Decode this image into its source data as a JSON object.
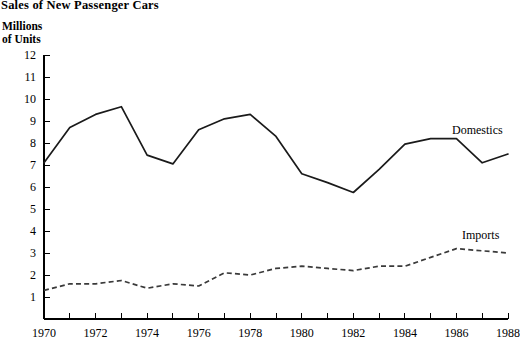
{
  "title": "l Sales of New Passenger Cars",
  "y_axis_title_line1": "Millions",
  "y_axis_title_line2": "of Units",
  "labels": {
    "domestics": "Domestics",
    "imports": "Imports"
  },
  "chart_data": {
    "type": "line",
    "title": "l Sales of New Passenger Cars",
    "xlabel": "",
    "ylabel": "Millions of Units",
    "ylim": [
      0,
      12
    ],
    "xlim": [
      1970,
      1988
    ],
    "grid": false,
    "legend_position": "inline-right",
    "y_ticks": [
      1,
      2,
      3,
      4,
      5,
      6,
      7,
      8,
      9,
      10,
      11,
      12
    ],
    "y_tick_labels": [
      "1",
      "2",
      "3",
      "4",
      "5",
      "6",
      "7",
      "8",
      "9",
      "10",
      "11",
      "12"
    ],
    "x_ticks": [
      1970,
      1971,
      1972,
      1973,
      1974,
      1975,
      1976,
      1977,
      1978,
      1979,
      1980,
      1981,
      1982,
      1983,
      1984,
      1985,
      1986,
      1987,
      1988
    ],
    "x_tick_labels_shown": [
      "1970",
      "1972",
      "1974",
      "1976",
      "1978",
      "1980",
      "1982",
      "1984",
      "1986",
      "1988"
    ],
    "x": [
      1970,
      1971,
      1972,
      1973,
      1974,
      1975,
      1976,
      1977,
      1978,
      1979,
      1980,
      1981,
      1982,
      1983,
      1984,
      1985,
      1986,
      1987,
      1988
    ],
    "series": [
      {
        "name": "Domestics",
        "style": "solid",
        "color": "#1a1a1a",
        "values": [
          7.1,
          8.7,
          9.3,
          9.65,
          7.45,
          7.05,
          8.6,
          9.1,
          9.3,
          8.3,
          6.6,
          6.2,
          5.75,
          6.8,
          7.95,
          8.2,
          8.2,
          7.1,
          7.5
        ]
      },
      {
        "name": "Imports",
        "style": "dashed",
        "color": "#3a3a3a",
        "values": [
          1.3,
          1.6,
          1.6,
          1.75,
          1.4,
          1.6,
          1.5,
          2.1,
          2.0,
          2.3,
          2.4,
          2.3,
          2.2,
          2.4,
          2.4,
          2.8,
          3.2,
          3.1,
          3.0
        ]
      }
    ]
  }
}
